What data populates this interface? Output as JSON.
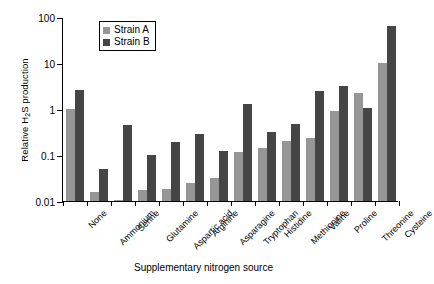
{
  "chart_data": {
    "type": "bar",
    "title": "",
    "xlabel": "Supplementary nitrogen source",
    "ylabel": "Relative H2S production",
    "ylabel_parts": {
      "pre": "Relative H",
      "sub": "2",
      "post": "S production"
    },
    "yscale": "log",
    "ylim": [
      0.01,
      100
    ],
    "yticks": [
      0.01,
      0.1,
      1,
      10,
      100
    ],
    "ytick_labels": [
      "0.01",
      "0.1",
      "1",
      "10",
      "100"
    ],
    "grid": false,
    "legend_position": "top-left-inside",
    "categories": [
      "None",
      "Ammonium",
      "Serine",
      "Glutamine",
      "Aspartic acid",
      "Arginine",
      "Asparagine",
      "Tryptophan",
      "Histidine",
      "Methionine",
      "Valine",
      "Proline",
      "Threonine",
      "Cysteine"
    ],
    "series": [
      {
        "name": "Strain A",
        "color": "#969696",
        "values": [
          1.0,
          0.016,
          0.0105,
          0.017,
          0.018,
          0.025,
          0.032,
          0.115,
          0.14,
          0.2,
          0.24,
          0.9,
          2.2,
          10.0
        ]
      },
      {
        "name": "Strain B",
        "color": "#454545",
        "values": [
          2.6,
          0.05,
          0.44,
          0.1,
          0.19,
          0.29,
          0.125,
          1.3,
          0.32,
          0.47,
          2.5,
          3.2,
          1.05,
          65.0
        ]
      }
    ]
  },
  "legend": {
    "items": [
      {
        "label": "Strain A",
        "color": "#969696"
      },
      {
        "label": "Strain B",
        "color": "#454545"
      }
    ]
  }
}
